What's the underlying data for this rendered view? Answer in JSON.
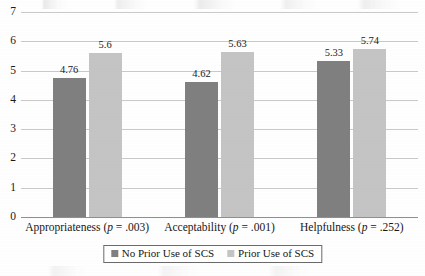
{
  "chart_data": {
    "type": "bar",
    "title": "",
    "subtitle": "",
    "xlabel": "",
    "ylabel": "",
    "ylim": [
      0,
      7
    ],
    "yticks": [
      "0",
      "1",
      "2",
      "3",
      "4",
      "5",
      "6",
      "7"
    ],
    "grid": true,
    "legend_position": "bottom-center",
    "categories": [
      "Appropriateness (p = .003)",
      "Acceptability (p = .001)",
      "Helpfulness (p = .252)"
    ],
    "category_parts": [
      {
        "name": "Appropriateness",
        "stat": "p",
        "relation": " = .003"
      },
      {
        "name": "Acceptability",
        "stat": "p",
        "relation": " = .001"
      },
      {
        "name": "Helpfulness",
        "stat": "p",
        "relation": " = .252"
      }
    ],
    "series": [
      {
        "name": "No Prior Use of SCS",
        "color": "#7f7f7f",
        "values": [
          4.76,
          4.62,
          5.33
        ],
        "labels": [
          "4.76",
          "4.62",
          "5.33"
        ]
      },
      {
        "name": "Prior Use of SCS",
        "color": "#c4c4c4",
        "values": [
          5.6,
          5.63,
          5.74
        ],
        "labels": [
          "5.6",
          "5.63",
          "5.74"
        ]
      }
    ]
  },
  "legend": {
    "entries": [
      {
        "label": "No Prior Use of SCS",
        "swatch": "dark"
      },
      {
        "label": "Prior Use of SCS",
        "swatch": "light"
      }
    ]
  }
}
